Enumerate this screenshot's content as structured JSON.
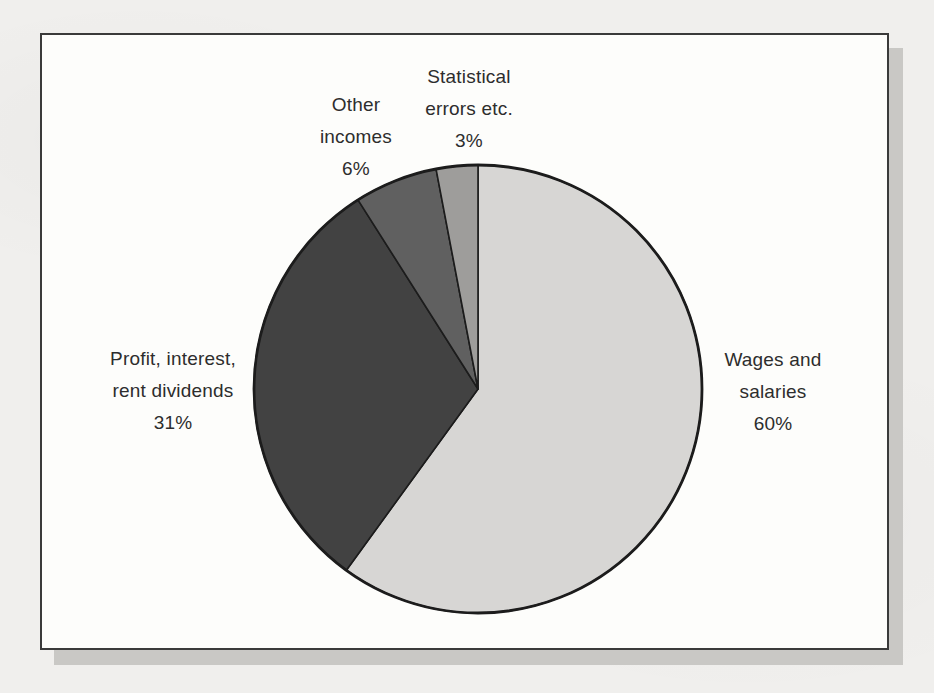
{
  "figure": {
    "kind": "scanned-pie-chart-figure"
  },
  "chart_data": {
    "type": "pie",
    "title": "",
    "start_angle_deg": 0,
    "direction": "clockwise",
    "outline_color": "#1c1c1c",
    "legend_position": "labels-around-pie",
    "slices": [
      {
        "label": "Wages and salaries",
        "value": 60,
        "value_text": "60%",
        "color": "#d7d6d4",
        "label_lines": [
          "Wages and",
          "salaries",
          "60%"
        ]
      },
      {
        "label": "Profit, interest, rent dividends",
        "value": 31,
        "value_text": "31%",
        "color": "#424242",
        "label_lines": [
          "Profit, interest,",
          "rent dividends",
          "31%"
        ]
      },
      {
        "label": "Other incomes",
        "value": 6,
        "value_text": "6%",
        "color": "#606060",
        "label_lines": [
          "Other",
          "incomes",
          "6%"
        ]
      },
      {
        "label": "Statistical errors etc.",
        "value": 3,
        "value_text": "3%",
        "color": "#9e9d9b",
        "label_lines": [
          "Statistical",
          "errors etc.",
          "3%"
        ]
      }
    ]
  }
}
